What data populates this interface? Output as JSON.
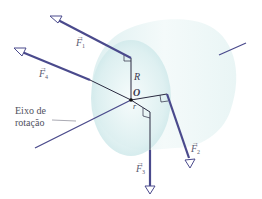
{
  "diagram": {
    "type": "torque-forces-on-cylinder",
    "origin_label": "O",
    "radius_label": "R",
    "lever_arm_label": "r",
    "axis_label_line1": "Eixo de",
    "axis_label_line2": "rotação",
    "forces": [
      {
        "id": "F1",
        "symbol": "F",
        "subscript": "1"
      },
      {
        "id": "F2",
        "symbol": "F",
        "subscript": "2"
      },
      {
        "id": "F3",
        "symbol": "F",
        "subscript": "3"
      },
      {
        "id": "F4",
        "symbol": "F",
        "subscript": "4"
      }
    ],
    "colors": {
      "vector": "#4a4a8c",
      "cylinder_light": "#eef8f8",
      "cylinder_mid": "#cfe9ea",
      "line_thin": "#2a2a40",
      "text": "#3a3a50"
    }
  }
}
